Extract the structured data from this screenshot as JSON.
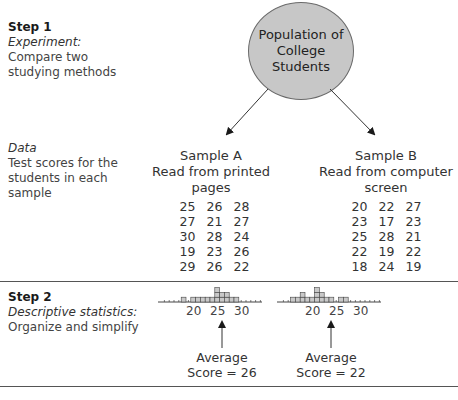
{
  "step1": {
    "label": "Step 1",
    "subtitle": "Experiment:",
    "desc_line1": "Compare two",
    "desc_line2": "studying methods"
  },
  "population": {
    "line1": "Population of",
    "line2": "College",
    "line3": "Students"
  },
  "data_section": {
    "subtitle": "Data",
    "line1": "Test scores for the",
    "line2": "students in each",
    "line3": "sample"
  },
  "sample_a": {
    "title": "Sample A",
    "line1": "Read from printed",
    "line2": "pages",
    "scores": [
      25,
      26,
      28,
      27,
      21,
      27,
      30,
      28,
      24,
      19,
      23,
      26,
      29,
      26,
      22
    ],
    "avg_label": "Average",
    "avg_value": "Score = 26"
  },
  "sample_b": {
    "title": "Sample B",
    "line1": "Read from computer",
    "line2": "screen",
    "scores": [
      20,
      22,
      27,
      23,
      17,
      23,
      25,
      28,
      21,
      22,
      19,
      22,
      18,
      24,
      19
    ],
    "avg_label": "Average",
    "avg_value": "Score = 22"
  },
  "step2": {
    "label": "Step 2",
    "subtitle": "Descriptive statistics:",
    "desc": "Organize and simplify"
  },
  "axis_ticks": [
    "20",
    "25",
    "30"
  ],
  "colors": {
    "circle_fill": "#c7c7c7",
    "square_fill": "#c9c9c9",
    "line": "#555555"
  }
}
